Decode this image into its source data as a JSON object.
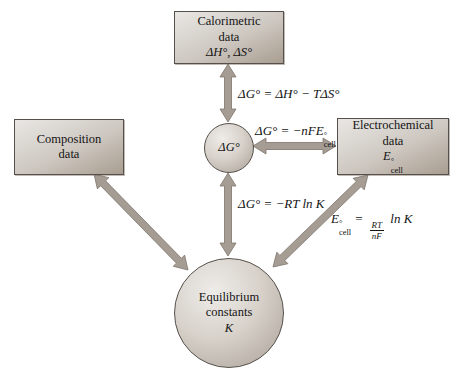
{
  "nodes": {
    "calorimetric": {
      "lines": [
        "Calorimetric",
        "data"
      ],
      "symbols": "ΔH°, ΔS°"
    },
    "composition": {
      "lines": [
        "Composition",
        "data"
      ]
    },
    "electrochemical": {
      "lines": [
        "Electrochemical",
        "data"
      ],
      "symbol_base": "E",
      "symbol_sup": "°",
      "symbol_sub": "cell"
    },
    "gibbs": {
      "label": "ΔG°"
    },
    "equilibrium": {
      "lines": [
        "Equilibrium",
        "constants"
      ],
      "symbol": "K"
    }
  },
  "equations": {
    "enthalpy": "ΔG° = ΔH° − TΔS°",
    "nfe": {
      "pre": "ΔG° = −nFE",
      "sup": "°",
      "sub": "cell"
    },
    "rtlnk": "ΔG° = −RT ln K",
    "ecell": {
      "base": "E",
      "sup": "°",
      "sub": "cell",
      "equals": " = ",
      "num": "RT",
      "den": "nF",
      "post": " ln K"
    }
  },
  "connections": [
    {
      "from": "calorimetric-data",
      "to": "gibbs-free-energy",
      "style": "double-arrow"
    },
    {
      "from": "gibbs-free-energy",
      "to": "electrochemical-data",
      "style": "double-arrow"
    },
    {
      "from": "gibbs-free-energy",
      "to": "equilibrium-constants",
      "style": "double-arrow"
    },
    {
      "from": "composition-data",
      "to": "equilibrium-constants",
      "style": "double-arrow"
    },
    {
      "from": "electrochemical-data",
      "to": "equilibrium-constants",
      "style": "double-arrow"
    }
  ],
  "colors": {
    "background": "#ffffff",
    "box_light": "#e9e7e4",
    "box_mid": "#cdc7c0",
    "box_dark": "#a89d90",
    "node_border": "#55504b",
    "arrow_fill": "#a59d94",
    "arrow_stroke": "#7d756c",
    "text": "#141414"
  }
}
